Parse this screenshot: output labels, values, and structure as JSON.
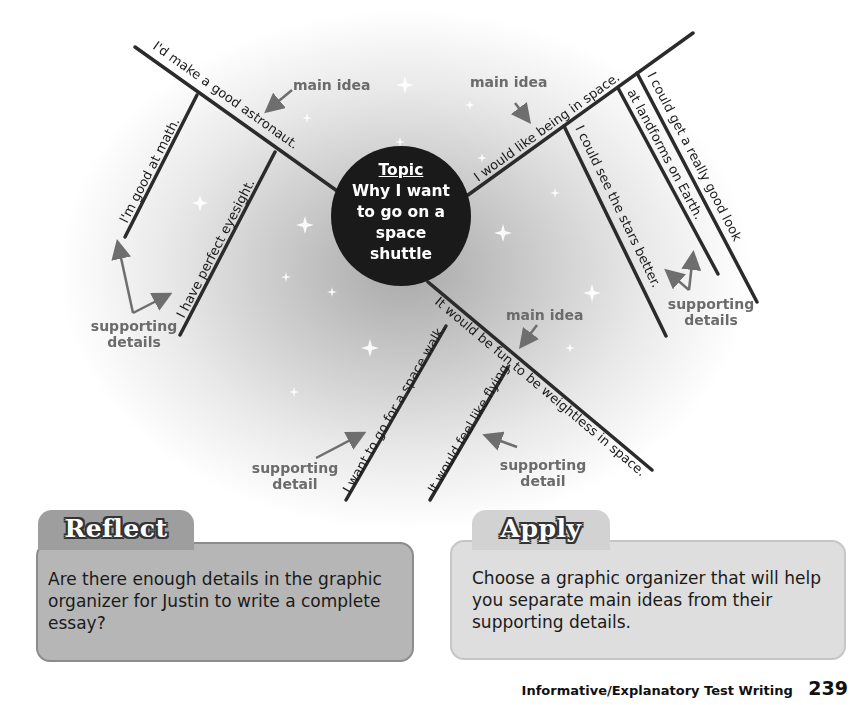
{
  "topic": {
    "label": "Topic",
    "text": "Why I want to go on a space shuttle"
  },
  "branches": [
    {
      "main_idea": "I'd make a good astronaut.",
      "details": [
        "I'm good at math.",
        "I have perfect eyesight."
      ]
    },
    {
      "main_idea": "I would like being in space.",
      "details": [
        "I could see the stars better.",
        "I could get a really good look",
        "at landforms on Earth."
      ]
    },
    {
      "main_idea": "It would be fun to be weightless in space.",
      "details": [
        "I want to go for a space walk.",
        "It would feel like flying."
      ]
    }
  ],
  "annotations": {
    "main_idea": "main idea",
    "supporting_details": "supporting details",
    "supporting_detail": "supporting detail"
  },
  "reflect": {
    "title": "Reflect",
    "text": "Are there enough details in the graphic organizer for Justin to write a complete essay?"
  },
  "apply": {
    "title": "Apply",
    "text": "Choose a graphic organizer that will help you separate main ideas from their supporting details."
  },
  "footer": {
    "title": "Informative/Explanatory Test Writing",
    "page": "239"
  },
  "colors": {
    "line": "#2b2b2b",
    "annotation": "#6b6b6b",
    "topic_bg": "#1a1a1a"
  }
}
